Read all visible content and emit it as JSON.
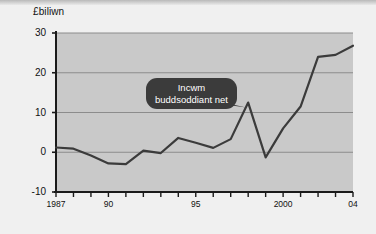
{
  "chart_data": {
    "type": "line",
    "title": "",
    "subtitle": "",
    "ylabel": "£biliwn",
    "xlabel": "",
    "ylim": [
      -10,
      30
    ],
    "xlim": [
      1987,
      2004
    ],
    "yticks": [
      30,
      20,
      10,
      0,
      -10
    ],
    "ytick_labels": [
      "30",
      "20",
      "10",
      "0",
      "-10"
    ],
    "xticks": [
      1987,
      1990,
      1995,
      2000,
      2004
    ],
    "xtick_labels": [
      "1987",
      "90",
      "95",
      "2000",
      "04"
    ],
    "grid": "horizontal",
    "legend": "none",
    "annotations": [
      {
        "name": "series-callout",
        "line1": "Incwm",
        "line2": "buddsoddiant net",
        "points_to_year": 1998
      }
    ],
    "series": [
      {
        "name": "Incwm buddsoddiant net",
        "color": "#3b3b3b",
        "x": [
          1987,
          1988,
          1989,
          1990,
          1991,
          1992,
          1993,
          1994,
          1995,
          1996,
          1997,
          1998,
          1999,
          2000,
          2001,
          2002,
          2003,
          2004
        ],
        "values": [
          1.2,
          0.9,
          -0.8,
          -2.8,
          -3.0,
          0.4,
          -0.2,
          3.6,
          2.4,
          1.1,
          3.3,
          12.5,
          -1.3,
          6.0,
          11.5,
          24.0,
          24.5,
          26.8
        ]
      }
    ]
  },
  "colors": {
    "plot_background": "#c9c9c9",
    "page_background": "#f1f1f1",
    "axis": "#1a1a1a",
    "gridline": "#8c8c8c",
    "series": "#3b3b3b",
    "callout_fill": "#3b3b3b",
    "callout_text": "#ffffff"
  }
}
